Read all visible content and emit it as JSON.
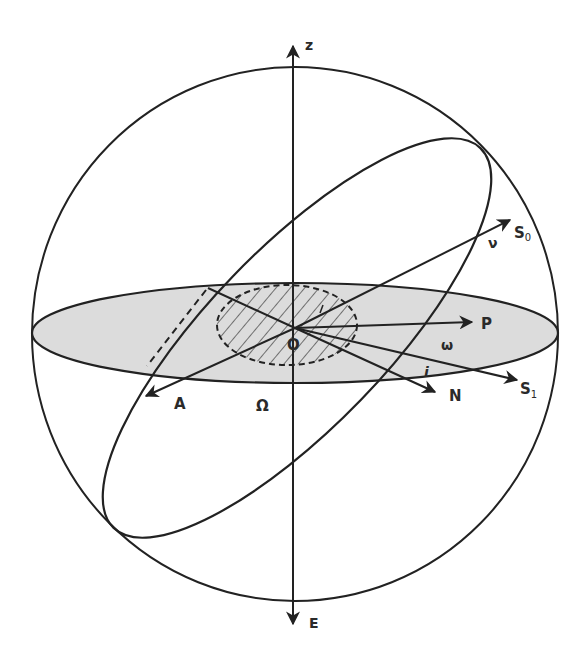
{
  "diagram": {
    "colors": {
      "stroke": "#222222",
      "equatorial_plane_fill": "#dcdcdc",
      "background": "#ffffff"
    },
    "labels": {
      "z_axis": "z",
      "e_axis": "E",
      "origin": "O",
      "s0_main": "S",
      "s0_sub": "0",
      "s1_main": "S",
      "s1_sub": "1",
      "pericenter": "P",
      "node": "N",
      "apocenter": "A",
      "longitude_node": "Ω",
      "argument_pericenter": "ω",
      "true_anomaly": "ν",
      "inclination": "i"
    },
    "geometry": {
      "sphere": {
        "cx": 295,
        "cy": 334,
        "rx": 263,
        "ry": 267
      },
      "equatorial_ellipse": {
        "cx": 295,
        "cy": 333,
        "rx": 263,
        "ry": 50
      },
      "hatched_region": {
        "cx": 287,
        "cy": 325,
        "rx": 70,
        "ry": 40
      },
      "orbit_ellipse": {
        "cx": 297,
        "cy": 338,
        "rx": 264,
        "ry": 89,
        "rotation_deg": -46
      },
      "origin_point": {
        "x": 295,
        "y": 328
      }
    },
    "vectors": [
      {
        "name": "S0",
        "x": 510,
        "y": 220
      },
      {
        "name": "P",
        "x": 472,
        "y": 322
      },
      {
        "name": "S1",
        "x": 517,
        "y": 380
      },
      {
        "name": "N",
        "x": 435,
        "y": 392
      },
      {
        "name": "A",
        "x": 146,
        "y": 396
      }
    ]
  }
}
